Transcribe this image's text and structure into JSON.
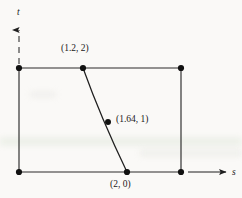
{
  "figure": {
    "type": "diagram",
    "caption_labels": {
      "point_top": "(1.2, 2)",
      "point_mid": "(1.64, 1)",
      "point_bottom": "(2, 0)"
    },
    "axes": {
      "vertical_label": "t",
      "horizontal_label": "s",
      "vertical_style": "dashed-with-arrow",
      "horizontal_style": "solid-with-arrow"
    },
    "colors": {
      "ink": "#1a1a1a",
      "background": "#faf9f7",
      "rule": "#2b2b2b"
    },
    "geometry": {
      "rectangle": {
        "top_left": [
          19,
          68
        ],
        "top_right": [
          181,
          68
        ],
        "bottom_right": [
          181,
          172
        ],
        "bottom_left": [
          19,
          172
        ]
      },
      "characteristic_curve": {
        "start": [
          83,
          68
        ],
        "control": [
          101,
          118
        ],
        "end": [
          127,
          172
        ],
        "marked_points": [
          {
            "at": [
              83,
              68
            ],
            "label": "(1.2, 2)"
          },
          {
            "at": [
              108,
              122
            ],
            "label": "(1.64, 1)"
          },
          {
            "at": [
              127,
              172
            ],
            "label": "(2, 0)"
          }
        ]
      },
      "vertex_dots": [
        [
          19,
          68
        ],
        [
          181,
          68
        ],
        [
          181,
          172
        ],
        [
          19,
          172
        ]
      ],
      "t_axis": {
        "from": [
          19,
          68
        ],
        "to": [
          19,
          28
        ],
        "arrow": true
      },
      "s_axis": {
        "from": [
          181,
          172
        ],
        "to": [
          228,
          172
        ],
        "arrow": true
      }
    }
  }
}
